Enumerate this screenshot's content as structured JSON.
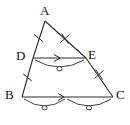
{
  "figure": {
    "kind": "geometry-diagram",
    "shape": "triangle-with-midsegment",
    "stroke_color": "#2b2b2b",
    "label_color": "#111111",
    "background_color": "#ffffff",
    "width": 130,
    "height": 125
  },
  "vertices": [
    {
      "id": "A",
      "label": "A",
      "x": 45,
      "y": 21,
      "label_x": 40,
      "label_y": 4
    },
    {
      "id": "B",
      "label": "B",
      "x": 22,
      "y": 97,
      "label_x": 5,
      "label_y": 90
    },
    {
      "id": "C",
      "label": "C",
      "x": 113,
      "y": 97,
      "label_x": 116,
      "label_y": 90
    },
    {
      "id": "D",
      "label": "D",
      "x": 33,
      "y": 58,
      "label_x": 16,
      "label_y": 50
    },
    {
      "id": "E",
      "label": "E",
      "x": 86,
      "y": 58,
      "label_x": 88,
      "label_y": 49
    }
  ],
  "segments": [
    {
      "id": "AD",
      "from": "A",
      "to": "D",
      "ticks": 1,
      "name": "segment-ad"
    },
    {
      "id": "DB",
      "from": "D",
      "to": "B",
      "ticks": 1,
      "name": "segment-db"
    },
    {
      "id": "AE",
      "from": "A",
      "to": "E",
      "ticks": 2,
      "name": "segment-ae"
    },
    {
      "id": "EC",
      "from": "E",
      "to": "C",
      "ticks": 2,
      "name": "segment-ec"
    },
    {
      "id": "DE",
      "from": "D",
      "to": "E",
      "ticks": 0,
      "arrow": 1,
      "name": "segment-de"
    },
    {
      "id": "BC",
      "from": "B",
      "to": "C",
      "ticks": 0,
      "arrow": 1,
      "name": "segment-bc"
    }
  ],
  "arc_markers": [
    {
      "id": "arc-de",
      "on": "DE",
      "marker": "circle",
      "count": 1,
      "name": "length-arc-de"
    },
    {
      "id": "arc-bd",
      "on": "BC-left",
      "marker": "circle",
      "count": 1,
      "name": "length-arc-bc-left"
    },
    {
      "id": "arc-dc",
      "on": "BC-right",
      "marker": "circle",
      "count": 1,
      "name": "length-arc-bc-right"
    }
  ]
}
